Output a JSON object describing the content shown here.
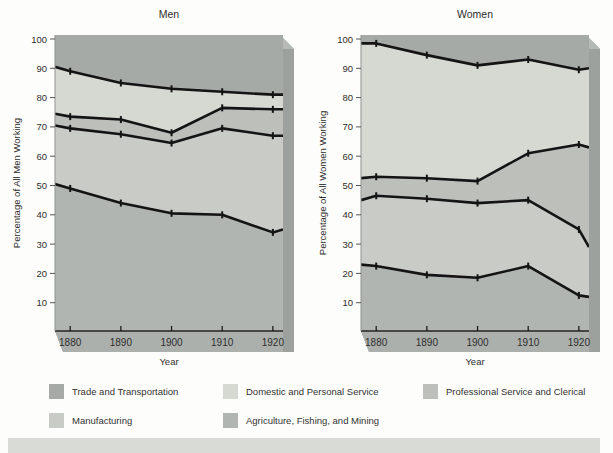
{
  "colors": {
    "trade": "#a6aaa6",
    "domestic": "#d6d8d2",
    "professional": "#bdbfbb",
    "manufacturing": "#c9cbc7",
    "agriculture": "#b1b5b1",
    "side_face": "#9da19d",
    "bottom_face": "#acb0ac",
    "bevel": "#b6bab6",
    "line": "#141414",
    "page_strip": "#d9dbd7"
  },
  "legend": {
    "items": [
      {
        "label": "Trade and Transportation",
        "color_key": "trade"
      },
      {
        "label": "Domestic and Personal Service",
        "color_key": "domestic"
      },
      {
        "label": "Professional Service and Clerical",
        "color_key": "professional"
      },
      {
        "label": "Manufacturing",
        "color_key": "manufacturing"
      },
      {
        "label": "Agriculture, Fishing, and Mining",
        "color_key": "agriculture"
      }
    ]
  },
  "page": {
    "bottom_strip": "next-page-section-edge"
  },
  "chart_data": [
    {
      "type": "area",
      "title": "Men",
      "xlabel": "Year",
      "ylabel": "Percentage of All Men Working",
      "x": [
        1877,
        1880,
        1890,
        1900,
        1910,
        1920,
        1922
      ],
      "x_ticks": [
        1880,
        1890,
        1900,
        1910,
        1920
      ],
      "xlim": [
        1877,
        1922
      ],
      "y_ticks": [
        10,
        20,
        30,
        40,
        50,
        60,
        70,
        80,
        90,
        100
      ],
      "ylim": [
        0,
        101
      ],
      "stacking": "values are cumulative top boundaries of each region, bottom region first; first and last x are plot-edge extensions",
      "series": [
        {
          "label": "Agriculture, Fishing, and Mining",
          "color_key": "agriculture",
          "values": [
            50.5,
            49,
            44,
            40.5,
            40,
            34,
            35
          ]
        },
        {
          "label": "Manufacturing",
          "color_key": "manufacturing",
          "values": [
            70.5,
            69.5,
            67.5,
            64.5,
            69.5,
            67,
            67
          ]
        },
        {
          "label": "Professional Service and Clerical",
          "color_key": "professional",
          "values": [
            74.5,
            73.5,
            72.5,
            68,
            76.5,
            76,
            76
          ]
        },
        {
          "label": "Domestic and Personal Service",
          "color_key": "domestic",
          "values": [
            90.5,
            89,
            85,
            83,
            82,
            81,
            81
          ]
        }
      ],
      "top_region": {
        "label": "Trade and Transportation",
        "color_key": "trade"
      }
    },
    {
      "type": "area",
      "title": "Women",
      "xlabel": "Year",
      "ylabel": "Percentage of All Women Working",
      "x": [
        1877,
        1880,
        1890,
        1900,
        1910,
        1920,
        1922
      ],
      "x_ticks": [
        1880,
        1890,
        1900,
        1910,
        1920
      ],
      "xlim": [
        1877,
        1922
      ],
      "y_ticks": [
        10,
        20,
        30,
        40,
        50,
        60,
        70,
        80,
        90,
        100
      ],
      "ylim": [
        0,
        101
      ],
      "stacking": "values are cumulative top boundaries of each region, bottom region first; first and last x are plot-edge extensions",
      "series": [
        {
          "label": "Agriculture, Fishing, and Mining",
          "color_key": "agriculture",
          "values": [
            23,
            22.5,
            19.5,
            18.5,
            22.5,
            12.5,
            12
          ]
        },
        {
          "label": "Manufacturing",
          "color_key": "manufacturing",
          "values": [
            45,
            46.5,
            45.5,
            44,
            45,
            35,
            29
          ]
        },
        {
          "label": "Professional Service and Clerical",
          "color_key": "professional",
          "values": [
            52.5,
            53,
            52.5,
            51.5,
            61,
            64,
            63
          ]
        },
        {
          "label": "Domestic and Personal Service",
          "color_key": "domestic",
          "values": [
            98.5,
            98.5,
            94.5,
            91,
            93,
            89.5,
            90
          ]
        }
      ],
      "top_region": {
        "label": "Trade and Transportation",
        "color_key": "trade"
      }
    }
  ]
}
